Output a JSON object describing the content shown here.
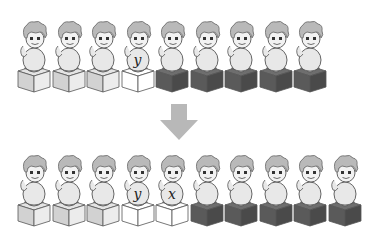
{
  "diagram": {
    "colors": {
      "cube_light": "#e4e4e4",
      "cube_white": "#ffffff",
      "cube_dark": "#5a5a5a",
      "hair": "#b9b9b9",
      "skin": "#f2f2f2",
      "body": "#e8e8e8",
      "outline": "#555555",
      "arrow": "#b8b8b8"
    },
    "top_row": {
      "y": 20,
      "pitch": 34.5,
      "x0": 17,
      "figures": [
        {
          "cube": "light",
          "label": ""
        },
        {
          "cube": "light",
          "label": ""
        },
        {
          "cube": "light",
          "label": ""
        },
        {
          "cube": "white",
          "label": "y"
        },
        {
          "cube": "dark",
          "label": ""
        },
        {
          "cube": "dark",
          "label": ""
        },
        {
          "cube": "dark",
          "label": ""
        },
        {
          "cube": "dark",
          "label": ""
        },
        {
          "cube": "dark",
          "label": ""
        }
      ]
    },
    "arrow": {
      "direction": "down",
      "icon": "down-arrow-icon"
    },
    "bottom_row": {
      "y": 154,
      "pitch": 34.5,
      "x0": 17,
      "figures": [
        {
          "cube": "light",
          "label": ""
        },
        {
          "cube": "light",
          "label": ""
        },
        {
          "cube": "light",
          "label": ""
        },
        {
          "cube": "white",
          "label": "y"
        },
        {
          "cube": "white",
          "label": "x"
        },
        {
          "cube": "dark",
          "label": ""
        },
        {
          "cube": "dark",
          "label": ""
        },
        {
          "cube": "dark",
          "label": ""
        },
        {
          "cube": "dark",
          "label": ""
        },
        {
          "cube": "dark",
          "label": ""
        }
      ]
    }
  }
}
